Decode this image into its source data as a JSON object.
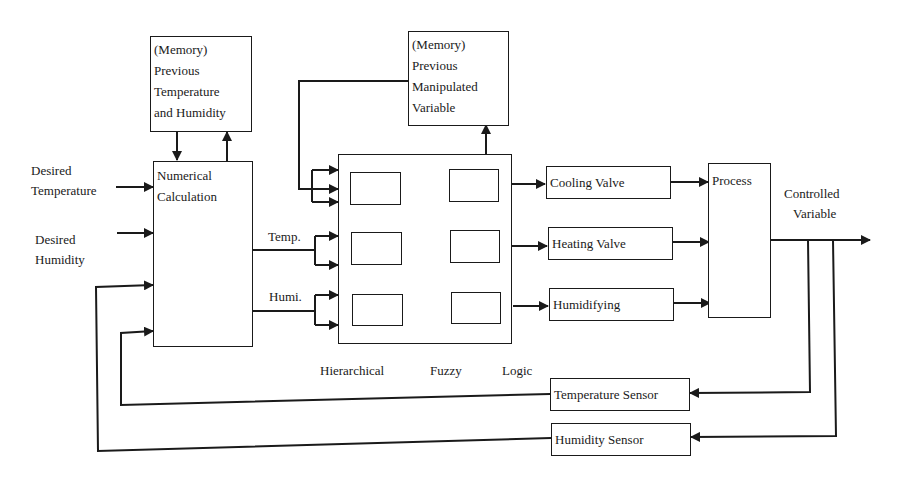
{
  "diagram": {
    "type": "block-diagram",
    "blocks": {
      "memory_temp_hum": {
        "lines": [
          "(Memory)",
          "Previous",
          "Temperature",
          "and Humidity"
        ]
      },
      "numerical_calc": {
        "lines": [
          "Numerical",
          "Calculation"
        ]
      },
      "memory_manip": {
        "lines": [
          "(Memory)",
          "Previous",
          "Manipulated",
          "Variable"
        ]
      },
      "cooling_valve": {
        "label": "Cooling Valve"
      },
      "heating_valve": {
        "label": "Heating Valve"
      },
      "humidifying": {
        "label": "Humidifying"
      },
      "process": {
        "label": "Process"
      },
      "temperature_sensor": {
        "label": "Temperature Sensor"
      },
      "humidity_sensor": {
        "label": "Humidity Sensor"
      }
    },
    "inputs": {
      "desired_temperature": {
        "lines": [
          "Desired",
          "Temperature"
        ]
      },
      "desired_humidity": {
        "lines": [
          "Desired",
          "Humidity"
        ]
      }
    },
    "signals": {
      "temp": "Temp.",
      "humi": "Humi.",
      "controlled_variable": [
        "Controlled",
        "Variable"
      ]
    },
    "fuzzy_caption": [
      "Hierarchical",
      "Fuzzy",
      "Logic"
    ],
    "edges": [
      {
        "from": "Desired Temperature",
        "to": "Numerical Calculation"
      },
      {
        "from": "Desired Humidity",
        "to": "Numerical Calculation"
      },
      {
        "from": "(Memory) Previous Temperature and Humidity",
        "to": "Numerical Calculation"
      },
      {
        "from": "Numerical Calculation",
        "to": "(Memory) Previous Temperature and Humidity"
      },
      {
        "from": "Numerical Calculation",
        "to": "Hierarchical Fuzzy Logic",
        "label": "Temp."
      },
      {
        "from": "Numerical Calculation",
        "to": "Hierarchical Fuzzy Logic",
        "label": "Humi."
      },
      {
        "from": "(Memory) Previous Manipulated Variable",
        "to": "Hierarchical Fuzzy Logic"
      },
      {
        "from": "Hierarchical Fuzzy Logic",
        "to": "(Memory) Previous Manipulated Variable"
      },
      {
        "from": "Hierarchical Fuzzy Logic",
        "to": "Cooling Valve"
      },
      {
        "from": "Hierarchical Fuzzy Logic",
        "to": "Heating Valve"
      },
      {
        "from": "Hierarchical Fuzzy Logic",
        "to": "Humidifying"
      },
      {
        "from": "Cooling Valve",
        "to": "Process"
      },
      {
        "from": "Heating Valve",
        "to": "Process"
      },
      {
        "from": "Humidifying",
        "to": "Process"
      },
      {
        "from": "Process",
        "to": "Controlled Variable"
      },
      {
        "from": "Controlled Variable",
        "to": "Temperature Sensor"
      },
      {
        "from": "Controlled Variable",
        "to": "Humidity Sensor"
      },
      {
        "from": "Temperature Sensor",
        "to": "Numerical Calculation"
      },
      {
        "from": "Humidity Sensor",
        "to": "Numerical Calculation"
      }
    ]
  }
}
